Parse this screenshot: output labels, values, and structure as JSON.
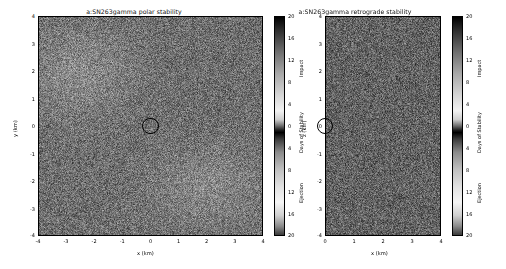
{
  "figure": {
    "background": "#ffffff",
    "width": 506,
    "height": 269
  },
  "panels": [
    {
      "id": "polar",
      "title": "a:SN263gamma polar stability",
      "xlabel": "x (km)",
      "ylabel": "y (km)",
      "xticks": [
        "-4",
        "-3",
        "-2",
        "-1",
        "0",
        "1",
        "2",
        "3",
        "4"
      ],
      "yticks": [
        "4",
        "3",
        "2",
        "1",
        "0",
        "-1",
        "-2",
        "-3",
        "-4"
      ],
      "xlim": [
        -4,
        4
      ],
      "ylim": [
        -4,
        4
      ],
      "marker": {
        "name": "body-outline-circle",
        "x": 0.0,
        "y": 0.0,
        "radius_km": 0.29
      },
      "colorbar": {
        "label": "Days of Stability",
        "top_segment_label": "Impact",
        "bottom_segment_label": "Ejection",
        "ticks": [
          "20",
          "16",
          "12",
          "8",
          "4",
          "0",
          "4",
          "8",
          "12",
          "16",
          "20"
        ]
      }
    },
    {
      "id": "retrograde",
      "title": "a:SN263gamma retrograde stability",
      "xlabel": "x (km)",
      "ylabel": "z (km)",
      "xticks": [
        "0",
        "1",
        "2",
        "3",
        "4"
      ],
      "yticks": [
        "4",
        "3",
        "2",
        "1",
        "0",
        "-1",
        "-2",
        "-3",
        "-4"
      ],
      "xlim": [
        0,
        4
      ],
      "ylim": [
        -4,
        4
      ],
      "marker": {
        "name": "body-outline-circle",
        "x": 0.0,
        "y": 0.0,
        "radius_km": 0.29
      },
      "colorbar": {
        "label": "Days of Stability",
        "top_segment_label": "Impact",
        "bottom_segment_label": "Ejection",
        "ticks": [
          "20",
          "16",
          "12",
          "8",
          "4",
          "0",
          "4",
          "8",
          "12",
          "16",
          "20"
        ]
      }
    }
  ],
  "chart_data": {
    "type": "heatmap",
    "colormap": "grey-diverging (dark at extremes, bright mid-band; dark band at 0)",
    "cbar_range": [
      -20,
      20
    ],
    "cbar_tick_values": [
      20,
      16,
      12,
      8,
      4,
      0,
      4,
      8,
      12,
      16,
      20
    ],
    "cbar_label": "Days of Stability",
    "cbar_upper_regime": "Impact",
    "cbar_lower_regime": "Ejection",
    "subplots": [
      {
        "name": "polar",
        "title": "a:SN263gamma polar stability",
        "xlabel": "x (km)",
        "ylabel": "y (km)",
        "xlim": [
          -4,
          4
        ],
        "ylim": [
          -4,
          4
        ],
        "xticks": [
          -4,
          -3,
          -2,
          -1,
          0,
          1,
          2,
          3,
          4
        ],
        "yticks": [
          -4,
          -3,
          -2,
          -1,
          0,
          1,
          2,
          3,
          4
        ],
        "grid": false,
        "description": "Speckled grey stability field with two bright (long-lived / high days-of-stability) lobes: one upper-left near (-2.5, 2.0) and one lower-right near (2.0, -2.0). Central black circle outlines the central body at the origin.",
        "bright_regions": [
          {
            "center_x": -2.5,
            "center_y": 2.0,
            "extent_x": 2.0,
            "extent_y": 1.8,
            "mean_days": 14
          },
          {
            "center_x": 2.0,
            "center_y": -2.2,
            "extent_x": 2.2,
            "extent_y": 1.6,
            "mean_days": 13
          }
        ],
        "background_mean_days": 6
      },
      {
        "name": "retrograde",
        "title": "a:SN263gamma retrograde stability",
        "xlabel": "x (km)",
        "ylabel": "z (km)",
        "xlim": [
          0,
          4
        ],
        "ylim": [
          -4,
          4
        ],
        "xticks": [
          0,
          1,
          2,
          3,
          4
        ],
        "yticks": [
          -4,
          -3,
          -2,
          -1,
          0,
          1,
          2,
          3,
          4
        ],
        "grid": false,
        "description": "Uniformly dark speckled stability field with no pronounced bright lobes; a partial black circle at the left edge marks the central body at x=0.",
        "bright_regions": [],
        "background_mean_days": 3
      }
    ]
  }
}
